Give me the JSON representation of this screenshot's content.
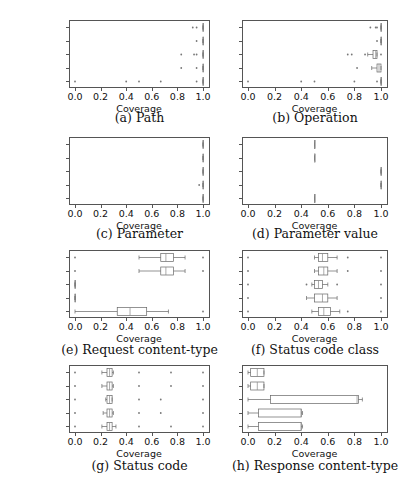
{
  "categories": [
    "baseline",
    "uTest",
    "bBOXRT",
    "RestTestGen",
    "RESTler"
  ],
  "italic_categories": [
    true,
    true,
    false,
    false,
    false
  ],
  "xticks": [
    "0.0",
    "0.2",
    "0.4",
    "0.6",
    "0.8",
    "1.0"
  ],
  "xlabel": "Coverage",
  "chart_data": [
    {
      "type": "boxplot",
      "title": "(a) Path",
      "xlabel": "Coverage",
      "xlim": [
        0,
        1
      ],
      "categories": [
        "baseline",
        "uTest",
        "bBOXRT",
        "RestTestGen",
        "RESTler"
      ],
      "series": [
        {
          "name": "baseline",
          "q1": 1.0,
          "median": 1.0,
          "q3": 1.0,
          "whisker_low": 1.0,
          "whisker_high": 1.0,
          "outliers": [
            0.92,
            0.95
          ]
        },
        {
          "name": "uTest",
          "q1": 1.0,
          "median": 1.0,
          "q3": 1.0,
          "whisker_low": 1.0,
          "whisker_high": 1.0,
          "outliers": [
            0.95
          ]
        },
        {
          "name": "bBOXRT",
          "q1": 1.0,
          "median": 1.0,
          "q3": 1.0,
          "whisker_low": 1.0,
          "whisker_high": 1.0,
          "outliers": [
            0.83,
            0.93,
            0.95
          ]
        },
        {
          "name": "RestTestGen",
          "q1": 1.0,
          "median": 1.0,
          "q3": 1.0,
          "whisker_low": 1.0,
          "whisker_high": 1.0,
          "outliers": [
            0.83,
            0.95
          ]
        },
        {
          "name": "RESTler",
          "q1": 1.0,
          "median": 1.0,
          "q3": 1.0,
          "whisker_low": 1.0,
          "whisker_high": 1.0,
          "outliers": [
            0.0,
            0.4,
            0.5,
            0.67,
            0.95
          ]
        }
      ]
    },
    {
      "type": "boxplot",
      "title": "(b) Operation",
      "xlabel": "Coverage",
      "xlim": [
        0,
        1
      ],
      "categories": [
        "baseline",
        "uTest",
        "bBOXRT",
        "RestTestGen",
        "RESTler"
      ],
      "series": [
        {
          "name": "baseline",
          "q1": 1.0,
          "median": 1.0,
          "q3": 1.0,
          "whisker_low": 1.0,
          "whisker_high": 1.0,
          "outliers": [
            0.92,
            0.96,
            0.97
          ]
        },
        {
          "name": "uTest",
          "q1": 1.0,
          "median": 1.0,
          "q3": 1.0,
          "whisker_low": 1.0,
          "whisker_high": 1.0,
          "outliers": [
            0.97
          ]
        },
        {
          "name": "bBOXRT",
          "q1": 0.94,
          "median": 0.96,
          "q3": 0.97,
          "whisker_low": 0.9,
          "whisker_high": 0.97,
          "outliers": [
            0.75,
            0.78,
            0.88,
            1.0
          ]
        },
        {
          "name": "RestTestGen",
          "q1": 0.97,
          "median": 0.985,
          "q3": 1.0,
          "whisker_low": 0.93,
          "whisker_high": 1.0,
          "outliers": [
            0.82
          ]
        },
        {
          "name": "RESTler",
          "q1": 1.0,
          "median": 1.0,
          "q3": 1.0,
          "whisker_low": 1.0,
          "whisker_high": 1.0,
          "outliers": [
            0.0,
            0.4,
            0.5,
            0.8,
            0.97
          ]
        }
      ]
    },
    {
      "type": "boxplot",
      "title": "(c) Parameter",
      "xlabel": "Coverage",
      "xlim": [
        0,
        1
      ],
      "categories": [
        "baseline",
        "uTest",
        "bBOXRT",
        "RestTestGen",
        "RESTler"
      ],
      "series": [
        {
          "name": "baseline",
          "q1": 1.0,
          "median": 1.0,
          "q3": 1.0,
          "whisker_low": 1.0,
          "whisker_high": 1.0,
          "outliers": []
        },
        {
          "name": "uTest",
          "q1": 1.0,
          "median": 1.0,
          "q3": 1.0,
          "whisker_low": 1.0,
          "whisker_high": 1.0,
          "outliers": []
        },
        {
          "name": "bBOXRT",
          "q1": 1.0,
          "median": 1.0,
          "q3": 1.0,
          "whisker_low": 1.0,
          "whisker_high": 1.0,
          "outliers": []
        },
        {
          "name": "RestTestGen",
          "q1": 1.0,
          "median": 1.0,
          "q3": 1.0,
          "whisker_low": 1.0,
          "whisker_high": 1.0,
          "outliers": [
            0.97
          ]
        },
        {
          "name": "RESTler",
          "q1": 1.0,
          "median": 1.0,
          "q3": 1.0,
          "whisker_low": 1.0,
          "whisker_high": 1.0,
          "outliers": []
        }
      ]
    },
    {
      "type": "boxplot",
      "title": "(d) Parameter value",
      "xlabel": "Coverage",
      "xlim": [
        0,
        1
      ],
      "categories": [
        "baseline",
        "uTest",
        "bBOXRT",
        "RestTestGen",
        "RESTler"
      ],
      "series": [
        {
          "name": "baseline",
          "q1": 0.5,
          "median": 0.5,
          "q3": 0.5,
          "whisker_low": 0.5,
          "whisker_high": 0.5,
          "outliers": []
        },
        {
          "name": "uTest",
          "q1": 0.5,
          "median": 0.5,
          "q3": 0.5,
          "whisker_low": 0.5,
          "whisker_high": 0.5,
          "outliers": []
        },
        {
          "name": "bBOXRT",
          "q1": 1.0,
          "median": 1.0,
          "q3": 1.0,
          "whisker_low": 1.0,
          "whisker_high": 1.0,
          "outliers": []
        },
        {
          "name": "RestTestGen",
          "q1": 1.0,
          "median": 1.0,
          "q3": 1.0,
          "whisker_low": 1.0,
          "whisker_high": 1.0,
          "outliers": []
        },
        {
          "name": "RESTler",
          "q1": 0.5,
          "median": 0.5,
          "q3": 0.5,
          "whisker_low": 0.5,
          "whisker_high": 0.5,
          "outliers": []
        }
      ]
    },
    {
      "type": "boxplot",
      "title": "(e) Request content-type",
      "xlabel": "Coverage",
      "xlim": [
        0,
        1
      ],
      "categories": [
        "baseline",
        "uTest",
        "bBOXRT",
        "RestTestGen",
        "RESTler"
      ],
      "series": [
        {
          "name": "baseline",
          "q1": 0.67,
          "median": 0.71,
          "q3": 0.77,
          "whisker_low": 0.5,
          "whisker_high": 0.86,
          "outliers": [
            0.0,
            1.0
          ]
        },
        {
          "name": "uTest",
          "q1": 0.67,
          "median": 0.71,
          "q3": 0.77,
          "whisker_low": 0.5,
          "whisker_high": 0.86,
          "outliers": [
            0.0,
            1.0
          ]
        },
        {
          "name": "bBOXRT",
          "q1": 0.0,
          "median": 0.0,
          "q3": 0.0,
          "whisker_low": 0.0,
          "whisker_high": 0.0,
          "outliers": []
        },
        {
          "name": "RestTestGen",
          "q1": 0.0,
          "median": 0.0,
          "q3": 0.0,
          "whisker_low": 0.0,
          "whisker_high": 0.0,
          "outliers": []
        },
        {
          "name": "RESTler",
          "q1": 0.33,
          "median": 0.43,
          "q3": 0.56,
          "whisker_low": 0.0,
          "whisker_high": 0.73,
          "outliers": [
            1.0
          ]
        }
      ]
    },
    {
      "type": "boxplot",
      "title": "(f) Status code class",
      "xlabel": "Coverage",
      "xlim": [
        0,
        1
      ],
      "categories": [
        "baseline",
        "uTest",
        "bBOXRT",
        "RestTestGen",
        "RESTler"
      ],
      "series": [
        {
          "name": "baseline",
          "q1": 0.53,
          "median": 0.56,
          "q3": 0.6,
          "whisker_low": 0.5,
          "whisker_high": 0.67,
          "outliers": [
            0.0,
            0.75,
            1.0
          ]
        },
        {
          "name": "uTest",
          "q1": 0.53,
          "median": 0.57,
          "q3": 0.6,
          "whisker_low": 0.5,
          "whisker_high": 0.67,
          "outliers": [
            0.0,
            0.75,
            1.0
          ]
        },
        {
          "name": "bBOXRT",
          "q1": 0.5,
          "median": 0.53,
          "q3": 0.56,
          "whisker_low": 0.48,
          "whisker_high": 0.6,
          "outliers": [
            0.0,
            0.44,
            0.67,
            1.0
          ]
        },
        {
          "name": "RestTestGen",
          "q1": 0.5,
          "median": 0.56,
          "q3": 0.6,
          "whisker_low": 0.44,
          "whisker_high": 0.67,
          "outliers": [
            0.0,
            1.0
          ]
        },
        {
          "name": "RESTler",
          "q1": 0.53,
          "median": 0.57,
          "q3": 0.62,
          "whisker_low": 0.48,
          "whisker_high": 0.69,
          "outliers": [
            0.0,
            0.75,
            1.0
          ]
        }
      ]
    },
    {
      "type": "boxplot",
      "title": "(g) Status code",
      "xlabel": "Coverage",
      "xlim": [
        0,
        1
      ],
      "categories": [
        "baseline",
        "uTest",
        "bBOXRT",
        "RestTestGen",
        "RESTler"
      ],
      "series": [
        {
          "name": "baseline",
          "q1": 0.25,
          "median": 0.27,
          "q3": 0.29,
          "whisker_low": 0.21,
          "whisker_high": 0.3,
          "outliers": [
            0.0,
            0.5,
            0.75,
            1.0
          ]
        },
        {
          "name": "uTest",
          "q1": 0.25,
          "median": 0.27,
          "q3": 0.29,
          "whisker_low": 0.21,
          "whisker_high": 0.3,
          "outliers": [
            0.0,
            0.5,
            0.75,
            1.0
          ]
        },
        {
          "name": "bBOXRT",
          "q1": 0.25,
          "median": 0.27,
          "q3": 0.29,
          "whisker_low": 0.24,
          "whisker_high": 0.29,
          "outliers": [
            0.0,
            0.5,
            0.67,
            1.0
          ]
        },
        {
          "name": "RestTestGen",
          "q1": 0.25,
          "median": 0.27,
          "q3": 0.29,
          "whisker_low": 0.22,
          "whisker_high": 0.3,
          "outliers": [
            0.0,
            0.5,
            0.67,
            1.0
          ]
        },
        {
          "name": "RESTler",
          "q1": 0.25,
          "median": 0.27,
          "q3": 0.29,
          "whisker_low": 0.21,
          "whisker_high": 0.32,
          "outliers": [
            0.0,
            0.5,
            0.75,
            1.0
          ]
        }
      ]
    },
    {
      "type": "boxplot",
      "title": "(h) Response content-type",
      "xlabel": "Coverage",
      "xlim": [
        0,
        1
      ],
      "categories": [
        "baseline",
        "uTest",
        "bBOXRT",
        "RestTestGen",
        "RESTler"
      ],
      "series": [
        {
          "name": "baseline",
          "q1": 0.02,
          "median": 0.07,
          "q3": 0.12,
          "whisker_low": 0.0,
          "whisker_high": 0.12,
          "outliers": []
        },
        {
          "name": "uTest",
          "q1": 0.02,
          "median": 0.07,
          "q3": 0.12,
          "whisker_low": 0.0,
          "whisker_high": 0.12,
          "outliers": []
        },
        {
          "name": "bBOXRT",
          "q1": 0.17,
          "median": 0.82,
          "q3": 0.83,
          "whisker_low": 0.0,
          "whisker_high": 0.86,
          "outliers": []
        },
        {
          "name": "RestTestGen",
          "q1": 0.08,
          "median": 0.4,
          "q3": 0.4,
          "whisker_low": 0.0,
          "whisker_high": 0.41,
          "outliers": []
        },
        {
          "name": "RESTler",
          "q1": 0.08,
          "median": 0.4,
          "q3": 0.4,
          "whisker_low": 0.0,
          "whisker_high": 0.41,
          "outliers": []
        }
      ]
    }
  ]
}
